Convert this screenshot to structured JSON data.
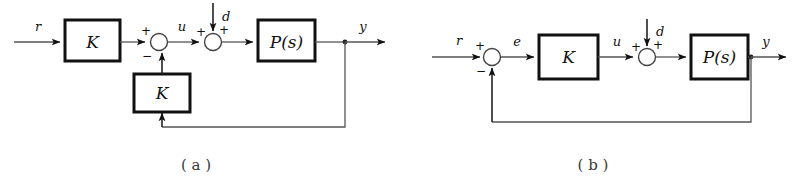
{
  "figure": {
    "type": "control-block-diagram",
    "background_color": "#ffffff",
    "line_color": "#555555",
    "box_border_color": "#111111"
  },
  "diagram_a": {
    "caption": "( a )",
    "blocks": [
      {
        "id": "gain-forward",
        "label": "K"
      },
      {
        "id": "plant",
        "label": "P(s)"
      },
      {
        "id": "gain-feedback",
        "label": "K"
      }
    ],
    "signals": {
      "reference": "r",
      "control": "u",
      "disturbance": "d",
      "output": "y"
    },
    "sum_junction_1": {
      "sign_top": "+",
      "sign_bottom": "−"
    },
    "sum_junction_2": {
      "sign_left": "+",
      "sign_right": "+"
    }
  },
  "diagram_b": {
    "caption": "( b )",
    "blocks": [
      {
        "id": "gain-forward",
        "label": "K"
      },
      {
        "id": "plant",
        "label": "P(s)"
      }
    ],
    "signals": {
      "reference": "r",
      "error": "e",
      "control": "u",
      "disturbance": "d",
      "output": "y"
    },
    "sum_junction_1": {
      "sign_top": "+",
      "sign_bottom": "−"
    },
    "sum_junction_2": {
      "sign_left": "+",
      "sign_right": "+"
    }
  }
}
